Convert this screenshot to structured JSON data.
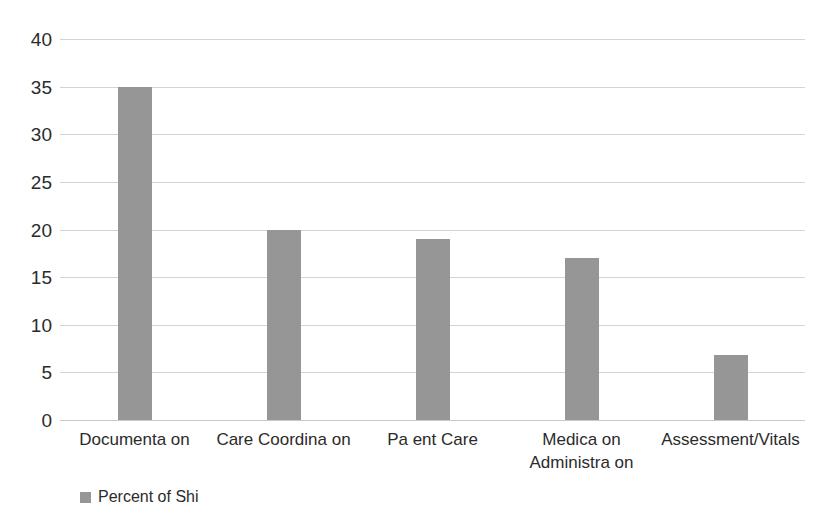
{
  "chart_data": {
    "type": "bar",
    "title": "",
    "xlabel": "",
    "ylabel": "",
    "categories": [
      "Documenta on",
      "Care Coordina on",
      "Pa ent Care",
      "Medica on\nAdministra on",
      "Assessment/Vitals"
    ],
    "values": [
      35,
      20,
      19,
      17,
      6.8
    ],
    "series": [
      {
        "name": "Percent of Shi",
        "values": [
          35,
          20,
          19,
          17,
          6.8
        ]
      }
    ],
    "ylim": [
      0,
      40
    ],
    "yticks": [
      0,
      5,
      10,
      15,
      20,
      25,
      30,
      35,
      40
    ],
    "ytick_labels": [
      "0",
      "5",
      "10",
      "15",
      "20",
      "25",
      "30",
      "35",
      "40"
    ],
    "grid": true,
    "grid_axis": "y",
    "legend": {
      "position": "bottom-left",
      "entries": [
        {
          "label": "Percent of Shi",
          "color": "#969696"
        }
      ]
    },
    "bar_color": "#969696",
    "gridline_color": "#d3d3d3",
    "background_color": "#ffffff",
    "text_color": "#2b2b2b"
  }
}
